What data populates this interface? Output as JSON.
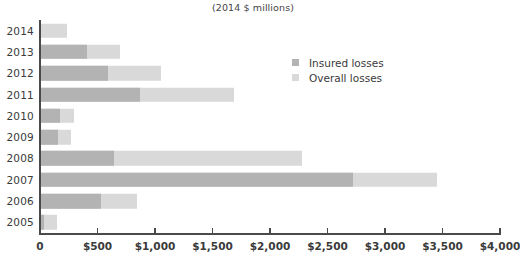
{
  "chart_data": {
    "type": "bar",
    "orientation": "horizontal",
    "stacked_overlay": true,
    "title": "(2014 $ millions)",
    "xlabel": "",
    "ylabel": "",
    "xlim": [
      0,
      4000
    ],
    "ylim": null,
    "grid": false,
    "legend_position": "upper-right-inside",
    "categories": [
      "2014",
      "2013",
      "2012",
      "2011",
      "2010",
      "2009",
      "2008",
      "2007",
      "2006",
      "2005"
    ],
    "series": [
      {
        "name": "Insured losses",
        "color": "#b3b3b3",
        "values": [
          0,
          400,
          580,
          860,
          165,
          145,
          635,
          2715,
          520,
          25
        ]
      },
      {
        "name": "Overall losses",
        "color": "#d9d9d9",
        "values": [
          225,
          690,
          1045,
          1680,
          285,
          265,
          2270,
          3440,
          835,
          135
        ]
      }
    ],
    "xticks": [
      0,
      500,
      1000,
      1500,
      2000,
      2500,
      3000,
      3500,
      4000
    ],
    "xtick_labels": [
      "0",
      "$500",
      "$1,000",
      "$1,500",
      "$2,000",
      "$2,500",
      "$3,000",
      "$3,500",
      "$4,000"
    ],
    "annotations": []
  },
  "legend": {
    "items": [
      {
        "label": "Insured losses",
        "color": "#b3b3b3"
      },
      {
        "label": "Overall losses",
        "color": "#d9d9d9"
      }
    ]
  },
  "colors": {
    "insured": "#b3b3b3",
    "overall": "#d9d9d9",
    "axis": "#4a4a4a",
    "text": "#3a3a3a",
    "background": "#ffffff"
  }
}
